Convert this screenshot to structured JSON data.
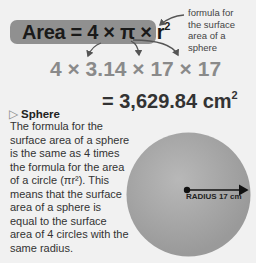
{
  "formula": {
    "label": "Area",
    "equals": "=",
    "expression": "4 × π × r",
    "exponent": "2"
  },
  "annotation": {
    "lines": [
      "formula for",
      "the surface",
      "area of a",
      "sphere"
    ]
  },
  "calculation": "4 × 3.14 × 17 × 17",
  "result": {
    "text": "= 3,629.84 cm",
    "exponent": "2"
  },
  "section": {
    "icon": "triangle-right-icon",
    "heading": "Sphere",
    "body": "The formula for the surface area of a sphere is the same as 4 times the formula for the area of a circle (πr²). This means that the surface area of a sphere is equal to the surface area of 4 circles with the same radius."
  },
  "sphere": {
    "radius_label": "RADIUS 17 cm",
    "fill_color": "#a6a6a6"
  },
  "colors": {
    "background": "#f1f1f1",
    "pill": "#909090",
    "calc_text": "#8a8a8a"
  }
}
